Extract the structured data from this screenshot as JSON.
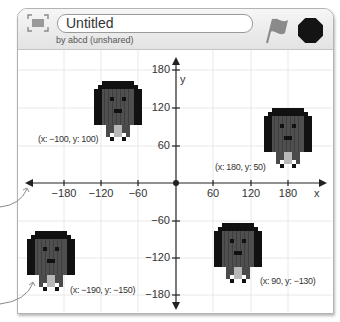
{
  "header": {
    "title": "Untitled",
    "subtitle": "by abcd (unshared)",
    "fullscreen_icon": "fullscreen-icon",
    "green_flag_icon": "green-flag-icon",
    "stop_icon": "stop-icon"
  },
  "stage": {
    "axis_labels": {
      "x": "x",
      "y": "y"
    },
    "x_ticks": [
      {
        "value": -180,
        "label": "−180"
      },
      {
        "value": -120,
        "label": "−120"
      },
      {
        "value": -60,
        "label": "−60"
      },
      {
        "value": 60,
        "label": "60"
      },
      {
        "value": 120,
        "label": "120"
      },
      {
        "value": 180,
        "label": "180"
      }
    ],
    "y_ticks": [
      {
        "value": 180,
        "label": "180"
      },
      {
        "value": 120,
        "label": "120"
      },
      {
        "value": 60,
        "label": "60"
      },
      {
        "value": -60,
        "label": "−60"
      },
      {
        "value": -120,
        "label": "−120"
      },
      {
        "value": -180,
        "label": "−180"
      }
    ],
    "sprites": [
      {
        "x": -100,
        "y": 100,
        "label": "(x: −100, y: 100)"
      },
      {
        "x": 180,
        "y": 50,
        "label": "(x: 180, y: 50)"
      },
      {
        "x": -190,
        "y": -150,
        "label": "(x: −190, y: −150)"
      },
      {
        "x": 90,
        "y": -130,
        "label": "(x: 90, y: −130)"
      }
    ]
  },
  "colors": {
    "hair": "#111111",
    "face": "#4f4f4f",
    "neck": "#b8b8b8",
    "flag": "#8a8a8a",
    "stop": "#141414",
    "grid": "#e8e8e8",
    "axis": "#222222"
  }
}
